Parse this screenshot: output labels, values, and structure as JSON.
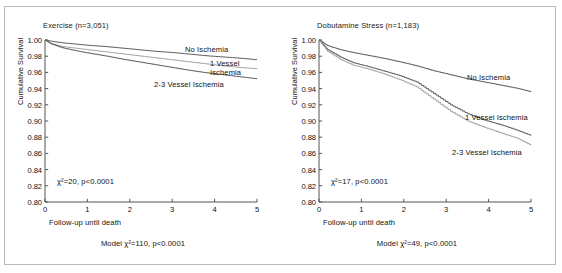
{
  "chart_data": [
    {
      "id": "exercise",
      "type": "line",
      "title": "Exercise (n=3,051)",
      "xlabel": "Follow-up until death",
      "ylabel": "Cumulative Survival",
      "xlim": [
        0,
        5
      ],
      "ylim": [
        0.8,
        1.0
      ],
      "xticks": [
        "0",
        "1",
        "2",
        "3",
        "4",
        "5"
      ],
      "yticks": [
        "1.00",
        "0.98",
        "0.96",
        "0.94",
        "0.92",
        "0.90",
        "0.88",
        "0.86",
        "0.84",
        "0.82",
        "0.80"
      ],
      "grid": false,
      "legend_position": "inline-right-of-curves",
      "annotation": "χ²=20, p<0.0001",
      "caption": "Model χ²=110, p<0.0001",
      "series": [
        {
          "name": "No Ischemia",
          "color": "#4d4d4d",
          "x": [
            0,
            0.15,
            0.4,
            0.7,
            1.0,
            1.4,
            1.8,
            2.2,
            2.6,
            3.0,
            3.4,
            3.8,
            4.2,
            4.6,
            5.0
          ],
          "values": [
            1.0,
            0.9985,
            0.9965,
            0.995,
            0.9935,
            0.992,
            0.99,
            0.988,
            0.986,
            0.9845,
            0.9825,
            0.9805,
            0.979,
            0.9775,
            0.9755
          ]
        },
        {
          "name": "1 Vessel Ischemia",
          "color": "#9a9a9a",
          "x": [
            0,
            0.15,
            0.4,
            0.7,
            1.0,
            1.4,
            1.8,
            2.2,
            2.6,
            3.0,
            3.4,
            3.8,
            4.2,
            4.6,
            5.0
          ],
          "values": [
            1.0,
            0.9955,
            0.992,
            0.99,
            0.988,
            0.9855,
            0.983,
            0.9805,
            0.978,
            0.9755,
            0.973,
            0.9705,
            0.968,
            0.966,
            0.9645
          ]
        },
        {
          "name": "2-3 Vessel Ischemia",
          "color": "#4d4d4d",
          "x": [
            0,
            0.15,
            0.4,
            0.7,
            1.0,
            1.4,
            1.8,
            2.2,
            2.6,
            3.0,
            3.4,
            3.8,
            4.2,
            4.6,
            5.0
          ],
          "values": [
            1.0,
            0.995,
            0.9905,
            0.987,
            0.984,
            0.9805,
            0.9765,
            0.973,
            0.9695,
            0.966,
            0.9625,
            0.9595,
            0.957,
            0.9545,
            0.952
          ]
        }
      ]
    },
    {
      "id": "dobutamine",
      "type": "line",
      "title": "Dobutamine Stress (n=1,183)",
      "xlabel": "Follow-up until death",
      "ylabel": "Cumulative Survival",
      "xlim": [
        0,
        5
      ],
      "ylim": [
        0.8,
        1.0
      ],
      "xticks": [
        "0",
        "1",
        "2",
        "3",
        "4",
        "5"
      ],
      "yticks": [
        "1.00",
        "0.98",
        "0.96",
        "0.94",
        "0.92",
        "0.90",
        "0.88",
        "0.86",
        "0.84",
        "0.82",
        "0.80"
      ],
      "grid": false,
      "legend_position": "inline-right-of-curves",
      "annotation": "χ²=17, p<0.0001",
      "caption": "Model χ²=49, p<0.0001",
      "series": [
        {
          "name": "No Ischemia",
          "color": "#4d4d4d",
          "x": [
            0,
            0.2,
            0.5,
            0.8,
            1.1,
            1.5,
            1.9,
            2.3,
            2.7,
            3.1,
            3.5,
            3.9,
            4.3,
            4.7,
            5.0
          ],
          "values": [
            1.0,
            0.993,
            0.988,
            0.9845,
            0.9815,
            0.9775,
            0.973,
            0.968,
            0.962,
            0.957,
            0.952,
            0.948,
            0.944,
            0.94,
            0.936
          ]
        },
        {
          "name": "1 Vessel Ischemia",
          "color": "#4d4d4d",
          "x": [
            0,
            0.2,
            0.5,
            0.8,
            1.1,
            1.5,
            1.9,
            2.3,
            2.7,
            3.1,
            3.5,
            3.9,
            4.3,
            4.7,
            5.0
          ],
          "values": [
            1.0,
            0.988,
            0.979,
            0.972,
            0.968,
            0.962,
            0.956,
            0.948,
            0.934,
            0.92,
            0.909,
            0.901,
            0.895,
            0.888,
            0.882
          ]
        },
        {
          "name": "2-3 Vessel Ischemia",
          "color": "#9a9a9a",
          "x": [
            0,
            0.2,
            0.5,
            0.8,
            1.1,
            1.5,
            1.9,
            2.3,
            2.7,
            3.1,
            3.5,
            3.9,
            4.3,
            4.7,
            5.0
          ],
          "values": [
            1.0,
            0.986,
            0.976,
            0.969,
            0.965,
            0.9585,
            0.951,
            0.942,
            0.927,
            0.912,
            0.9,
            0.892,
            0.885,
            0.878,
            0.87
          ]
        }
      ]
    }
  ],
  "left": {
    "title": "Exercise (n=3,051)",
    "xlabel": "Follow-up until death",
    "ylabel": "Cumulative Survival",
    "annotation": "χ²=20, p<0.0001",
    "caption": "Model χ²=110, p<0.0001",
    "label_no_ischemia": "No Ischemia",
    "label_one_vessel_line1": "1 Vessel",
    "label_one_vessel_line2": "Ischemia",
    "label_multi_vessel": "2-3 Vessel Ischemia"
  },
  "right": {
    "title": "Dobutamine Stress (n=1,183)",
    "xlabel": "Follow-up until death",
    "ylabel": "Cumulative Survival",
    "annotation": "χ²=17, p<0.0001",
    "caption": "Model χ²=49, p<0.0001",
    "label_no_ischemia": "No Ischemia",
    "label_one_vessel": "1 Vessel Ischemia",
    "label_multi_vessel": "2-3 Vessel Ischemia"
  }
}
